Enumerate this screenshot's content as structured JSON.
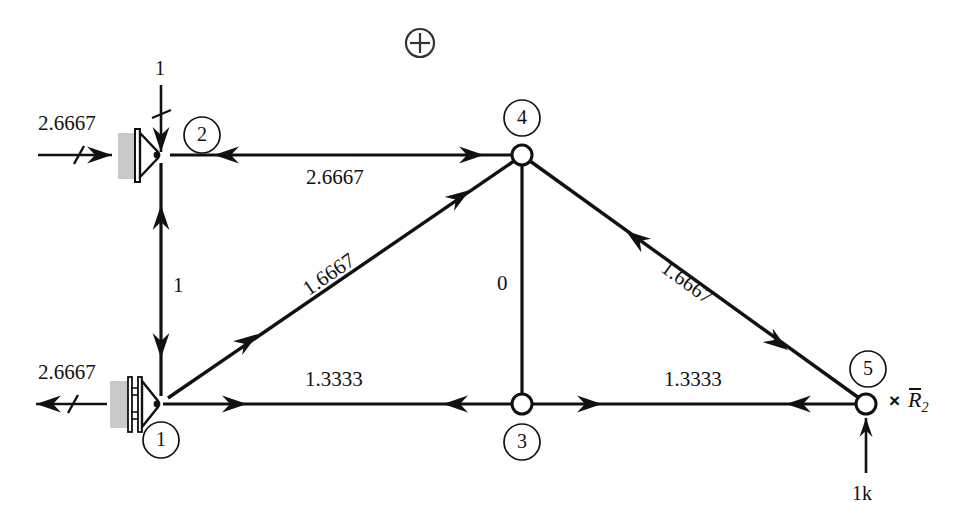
{
  "figure": {
    "type": "truss-force-diagram",
    "crosshair_symbol": "circled-plus"
  },
  "nodes": [
    {
      "id": "1",
      "label": "1",
      "x": 161,
      "y": 404,
      "support": "roller",
      "joint_style": "pin-triangle"
    },
    {
      "id": "2",
      "label": "2",
      "x": 161,
      "y": 155,
      "support": "pin-wall",
      "joint_style": "pin-triangle"
    },
    {
      "id": "3",
      "label": "3",
      "x": 522,
      "y": 404,
      "support": "none",
      "joint_style": "open-circle"
    },
    {
      "id": "4",
      "label": "4",
      "x": 522,
      "y": 155,
      "support": "none",
      "joint_style": "open-circle"
    },
    {
      "id": "5",
      "label": "5",
      "x": 866,
      "y": 404,
      "support": "none",
      "joint_style": "open-circle"
    }
  ],
  "members": [
    {
      "name": "top-chord-2-4",
      "from": "2",
      "to": "4",
      "force": "2.6667",
      "sense": "compression"
    },
    {
      "name": "left-vertical-1-2",
      "from": "1",
      "to": "2",
      "force": "1",
      "sense": "tension"
    },
    {
      "name": "diagonal-1-4",
      "from": "1",
      "to": "4",
      "force": "1.6667",
      "sense": "tension"
    },
    {
      "name": "center-vertical-3-4",
      "from": "3",
      "to": "4",
      "force": "0",
      "sense": "zero"
    },
    {
      "name": "diagonal-4-5",
      "from": "4",
      "to": "5",
      "force": "1.6667",
      "sense": "compression"
    },
    {
      "name": "bottom-chord-1-3",
      "from": "1",
      "to": "3",
      "force": "1.3333",
      "sense": "tension"
    },
    {
      "name": "bottom-chord-3-5",
      "from": "3",
      "to": "5",
      "force": "1.3333",
      "sense": "tension"
    }
  ],
  "loads": [
    {
      "name": "applied-load-node-2",
      "label": "1",
      "at_node": "2",
      "direction": "down"
    },
    {
      "name": "applied-load-node-5",
      "label": "1k",
      "at_node": "5",
      "direction": "up"
    }
  ],
  "reactions": [
    {
      "name": "reaction-node-2",
      "label": "2.6667",
      "at_node": "2",
      "direction": "right"
    },
    {
      "name": "reaction-node-1",
      "label": "2.6667",
      "at_node": "1",
      "direction": "left"
    }
  ],
  "annotation": {
    "multiply_sign": "×",
    "reaction_symbol": "R",
    "reaction_subscript": "2"
  },
  "colors": {
    "line": "#111111",
    "support_hatch": "#c9c9c9",
    "background": "#ffffff"
  }
}
